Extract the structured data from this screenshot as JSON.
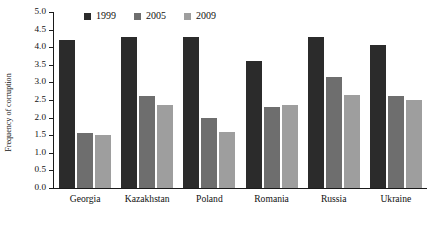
{
  "chart_data": {
    "type": "bar",
    "title": "",
    "xlabel": "",
    "ylabel": "Frequency of corruption",
    "ylim": [
      0.0,
      5.0
    ],
    "ytick_step": 0.5,
    "yticks": [
      "5.0",
      "4.5",
      "4.0",
      "3.5",
      "3.0",
      "2.5",
      "2.0",
      "1.5",
      "1.0",
      "0.5",
      "0.0"
    ],
    "grid": false,
    "legend_position": "top-center",
    "categories": [
      "Georgia",
      "Kazakhstan",
      "Poland",
      "Romania",
      "Russia",
      "Ukraine"
    ],
    "series": [
      {
        "name": "1999",
        "color": "#2b2b2b",
        "values": [
          4.2,
          4.3,
          4.3,
          3.6,
          4.3,
          4.05
        ]
      },
      {
        "name": "2005",
        "color": "#6e6e6e",
        "values": [
          1.55,
          2.6,
          2.0,
          2.3,
          3.15,
          2.6
        ]
      },
      {
        "name": "2009",
        "color": "#9e9e9e",
        "values": [
          1.5,
          2.35,
          1.6,
          2.35,
          2.65,
          2.5
        ]
      }
    ]
  }
}
